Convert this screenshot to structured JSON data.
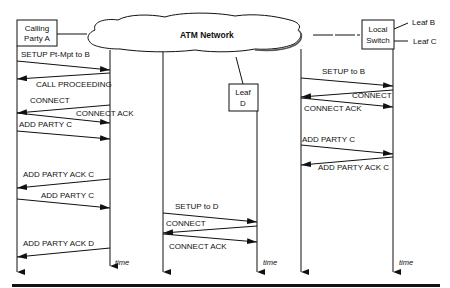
{
  "diagram": {
    "type": "message-sequence",
    "cloud_label": "ATM Network",
    "nodes": {
      "calling_party": {
        "line1": "Calling",
        "line2": "Party A"
      },
      "local_switch": {
        "line1": "Local",
        "line2": "Switch"
      },
      "leaf_d": {
        "line1": "Leaf",
        "line2": "D"
      },
      "leaf_b": "Leaf B",
      "leaf_c": "Leaf C"
    },
    "time_label": "time",
    "messages": [
      {
        "label": "SETUP Pt-Mpt to B",
        "from": "A",
        "to": "NetA"
      },
      {
        "label": "CALL PROCEEDING",
        "from": "NetA",
        "to": "A"
      },
      {
        "label": "CONNECT",
        "from": "NetA",
        "to": "A"
      },
      {
        "label": "CONNECT ACK",
        "from": "A",
        "to": "NetA"
      },
      {
        "label": "ADD PARTY C",
        "from": "A",
        "to": "NetA"
      },
      {
        "label": "ADD PARTY ACK C",
        "from": "NetA",
        "to": "A"
      },
      {
        "label": "ADD PARTY C",
        "from": "A",
        "to": "NetA"
      },
      {
        "label": "ADD PARTY ACK D",
        "from": "NetA",
        "to": "A"
      },
      {
        "label": "SETUP to B",
        "from": "NetB",
        "to": "Switch"
      },
      {
        "label": "CONNECT",
        "from": "Switch",
        "to": "NetB"
      },
      {
        "label": "CONNECT ACK",
        "from": "NetB",
        "to": "Switch"
      },
      {
        "label": "ADD PARTY C",
        "from": "NetB",
        "to": "Switch"
      },
      {
        "label": "ADD PARTY ACK C",
        "from": "Switch",
        "to": "NetB"
      },
      {
        "label": "SETUP to D",
        "from": "NetD",
        "to": "D"
      },
      {
        "label": "CONNECT",
        "from": "D",
        "to": "NetD"
      },
      {
        "label": "CONNECT ACK",
        "from": "NetD",
        "to": "D"
      }
    ]
  }
}
